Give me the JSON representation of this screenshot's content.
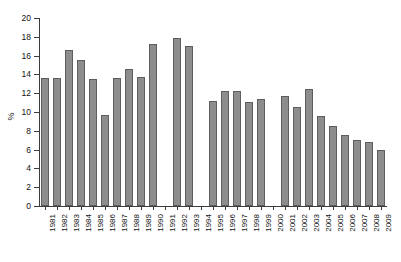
{
  "chart_data": {
    "type": "bar",
    "title": "",
    "subtitle": "",
    "xlabel": "",
    "ylabel": "%",
    "ylim": [
      0,
      20
    ],
    "ytick_step": 2,
    "yticks": [
      0,
      2,
      4,
      6,
      8,
      10,
      12,
      14,
      16,
      18,
      20
    ],
    "ytick_labels": [
      "0",
      "2",
      "4",
      "6",
      "8",
      "10",
      "12",
      "14",
      "16",
      "18",
      "20"
    ],
    "grid": false,
    "legend": null,
    "bar_color": "#8d8d8d",
    "bar_edge_color": "#5e5e5e",
    "axis_color": "#3c3c3c",
    "categories": [
      "1981",
      "1982",
      "1983",
      "1984",
      "1985",
      "1986",
      "1987",
      "1988",
      "1989",
      "1990",
      "1991",
      "1992",
      "1993",
      "1994",
      "1995",
      "1996",
      "1997",
      "1998",
      "1999",
      "2000",
      "2001",
      "2002",
      "2003",
      "2004",
      "2005",
      "2006",
      "2007",
      "2008",
      "2009"
    ],
    "values": [
      13.6,
      13.6,
      16.6,
      15.5,
      13.5,
      9.7,
      13.6,
      14.6,
      13.7,
      17.2,
      null,
      17.9,
      17.0,
      null,
      11.2,
      12.2,
      12.2,
      11.1,
      11.4,
      null,
      11.7,
      10.5,
      12.4,
      9.6,
      8.5,
      7.6,
      7.0,
      6.8,
      6.0
    ],
    "missing_categories": [
      "1991",
      "1994",
      "2000"
    ]
  }
}
